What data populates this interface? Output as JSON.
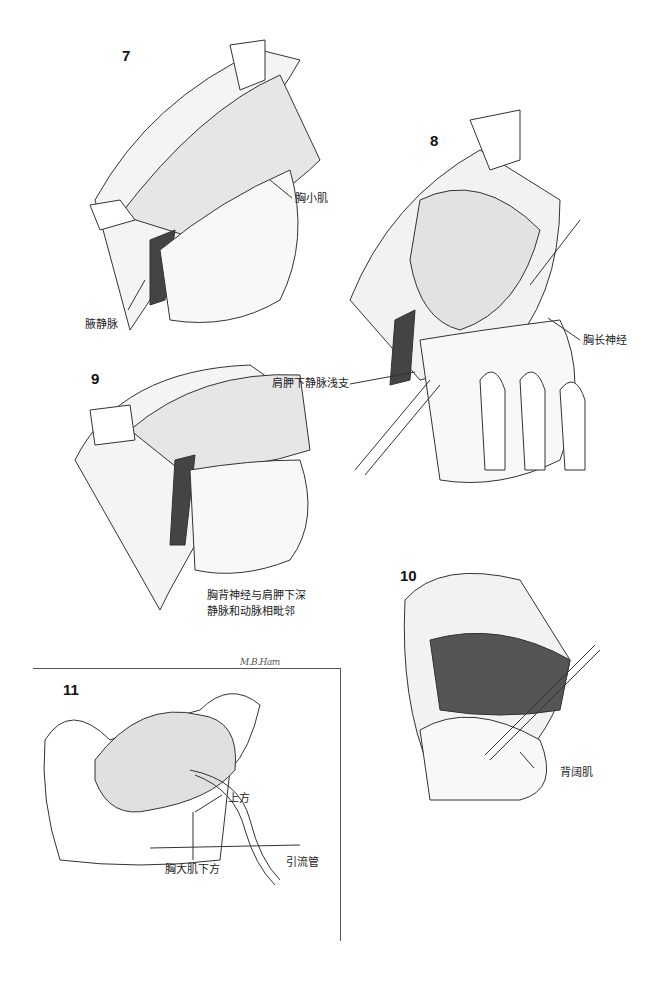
{
  "page": {
    "header": "",
    "figures": [
      {
        "number": "7",
        "labels": {
          "pectoralis_minor": "胸小肌",
          "axillary_vein": "腋静脉"
        }
      },
      {
        "number": "8",
        "labels": {
          "long_thoracic_nerve": "胸长神经",
          "subscapular_vein_branch": "肩胛下静脉浅支"
        }
      },
      {
        "number": "9",
        "labels": {
          "thoracodorsal_line1": "胸背神经与肩胛下深",
          "thoracodorsal_line2": "静脉和动脉相毗邻"
        }
      },
      {
        "number": "10",
        "labels": {
          "latissimus_dorsi": "背阔肌"
        }
      },
      {
        "number": "11",
        "labels": {
          "above": "上方",
          "below_pectoralis_major": "胸大肌下方",
          "drain": "引流管"
        }
      }
    ],
    "signature": "M.B.Ham"
  }
}
